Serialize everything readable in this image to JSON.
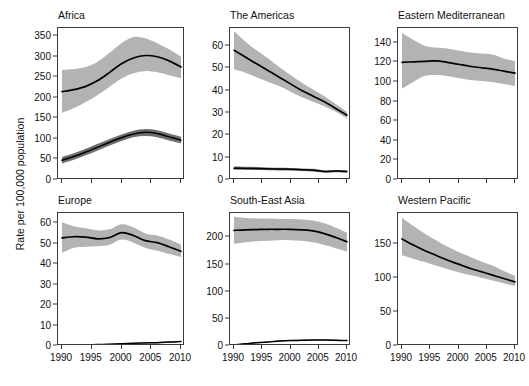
{
  "figure": {
    "ylabel": "Rate per 100,000 population",
    "xlabel": "",
    "xticks": [
      "1990",
      "1995",
      "2000",
      "2005",
      "2010"
    ],
    "xlim": [
      1990,
      2010
    ],
    "grid": false,
    "legend": "none",
    "band_color": "#b3b3b3",
    "band_color_dark": "#6e6e6e",
    "line_color": "#000000"
  },
  "chart_data": [
    {
      "type": "line",
      "title": "Africa",
      "xlabel": "",
      "ylabel": "Rate per 100,000 population",
      "x": [
        1990,
        1992,
        1994,
        1996,
        1998,
        2000,
        2002,
        2004,
        2006,
        2008,
        2010
      ],
      "xlim": [
        1990,
        2010
      ],
      "ylim": [
        0,
        370
      ],
      "yticks": [
        0,
        50,
        100,
        150,
        200,
        250,
        300,
        350
      ],
      "grid": false,
      "series": [
        {
          "name": "incidence",
          "values": [
            215,
            220,
            228,
            242,
            262,
            283,
            297,
            303,
            300,
            290,
            275
          ],
          "ci_low": [
            163,
            175,
            190,
            207,
            227,
            247,
            260,
            265,
            262,
            255,
            248
          ],
          "ci_high": [
            268,
            270,
            275,
            288,
            310,
            333,
            348,
            345,
            333,
            318,
            300
          ]
        },
        {
          "name": "mortality",
          "values": [
            48,
            57,
            68,
            80,
            92,
            103,
            112,
            116,
            113,
            105,
            97
          ],
          "ci_low": [
            40,
            49,
            60,
            72,
            84,
            95,
            104,
            107,
            104,
            96,
            89
          ],
          "ci_high": [
            56,
            65,
            76,
            88,
            100,
            111,
            120,
            124,
            121,
            113,
            105
          ]
        }
      ]
    },
    {
      "type": "line",
      "title": "The Americas",
      "xlabel": "",
      "ylabel": "",
      "x": [
        1990,
        1992,
        1994,
        1996,
        1998,
        2000,
        2002,
        2004,
        2006,
        2008,
        2010
      ],
      "xlim": [
        1990,
        2010
      ],
      "ylim": [
        0,
        68
      ],
      "yticks": [
        0,
        10,
        20,
        30,
        40,
        50,
        60
      ],
      "grid": false,
      "series": [
        {
          "name": "incidence",
          "values": [
            58,
            55,
            52,
            49,
            46,
            43,
            40,
            37.5,
            35,
            32,
            29
          ],
          "ci_low": [
            49.5,
            48,
            46,
            44,
            42,
            39.5,
            37,
            35,
            33,
            30.5,
            27.5
          ],
          "ci_high": [
            66.5,
            62,
            58,
            54.5,
            50.5,
            47,
            43.5,
            40.5,
            37.5,
            34,
            30.5
          ]
        },
        {
          "name": "mortality",
          "values": [
            5.3,
            5.2,
            5.1,
            5.0,
            4.9,
            4.8,
            4.6,
            4.4,
            3.8,
            4.0,
            3.8
          ],
          "ci_low": [
            4.6,
            4.6,
            4.5,
            4.4,
            4.3,
            4.2,
            4.0,
            3.8,
            3.3,
            3.5,
            3.3
          ],
          "ci_high": [
            6.0,
            5.9,
            5.8,
            5.6,
            5.5,
            5.4,
            5.2,
            5.0,
            4.3,
            4.5,
            4.3
          ]
        }
      ]
    },
    {
      "type": "line",
      "title": "Eastern Mediterranean",
      "xlabel": "",
      "ylabel": "",
      "x": [
        1990,
        1992,
        1994,
        1996,
        1998,
        2000,
        2002,
        2004,
        2006,
        2008,
        2010
      ],
      "xlim": [
        1990,
        2010
      ],
      "ylim": [
        0,
        155
      ],
      "yticks": [
        0,
        20,
        40,
        60,
        80,
        100,
        120,
        140
      ],
      "grid": false,
      "series": [
        {
          "name": "incidence",
          "values": [
            120,
            120.5,
            121,
            121.5,
            120,
            118,
            116,
            114.5,
            113,
            111,
            109
          ],
          "ci_low": [
            93,
            100,
            106,
            107,
            106,
            104,
            102,
            101,
            100,
            98,
            96
          ],
          "ci_high": [
            150,
            143,
            137,
            135,
            134,
            132,
            130,
            129,
            128,
            124,
            121
          ]
        },
        {
          "name": "mortality",
          "values": [
            0.7,
            0.8,
            0.8,
            0.9,
            0.9,
            1.0,
            1.0,
            1.1,
            1.1,
            1.2,
            1.2
          ],
          "ci_low": [
            0.4,
            0.5,
            0.5,
            0.6,
            0.6,
            0.7,
            0.7,
            0.8,
            0.8,
            0.9,
            0.9
          ],
          "ci_high": [
            1.1,
            1.2,
            1.2,
            1.3,
            1.3,
            1.4,
            1.4,
            1.5,
            1.5,
            1.6,
            1.6
          ]
        }
      ]
    },
    {
      "type": "line",
      "title": "Europe",
      "xlabel": "",
      "ylabel": "",
      "x": [
        1990,
        1992,
        1994,
        1996,
        1998,
        2000,
        2002,
        2004,
        2006,
        2008,
        2010
      ],
      "xlim": [
        1990,
        2010
      ],
      "ylim": [
        0,
        65
      ],
      "yticks": [
        0,
        10,
        20,
        30,
        40,
        50,
        60
      ],
      "grid": false,
      "series": [
        {
          "name": "incidence",
          "values": [
            52.8,
            53.4,
            53.2,
            52.4,
            53.0,
            55.4,
            54.0,
            51.5,
            50.5,
            48.5,
            46.3
          ],
          "ci_low": [
            45.5,
            48.0,
            48.5,
            48.8,
            49.5,
            52.0,
            50.5,
            48.0,
            46.5,
            45.0,
            43.5
          ],
          "ci_high": [
            60.5,
            58.5,
            57.5,
            56.5,
            57.0,
            59.5,
            58.0,
            55.0,
            54.0,
            52.0,
            49.5
          ]
        },
        {
          "name": "mortality",
          "values": [
            0.4,
            0.5,
            0.6,
            0.7,
            0.9,
            1.1,
            1.3,
            1.5,
            1.6,
            1.9,
            2.2
          ],
          "ci_low": [
            0.2,
            0.3,
            0.4,
            0.5,
            0.7,
            0.9,
            1.1,
            1.3,
            1.4,
            1.6,
            1.9
          ],
          "ci_high": [
            0.6,
            0.7,
            0.8,
            0.9,
            1.1,
            1.3,
            1.5,
            1.7,
            1.9,
            2.2,
            2.5
          ]
        }
      ]
    },
    {
      "type": "line",
      "title": "South-East Asia",
      "xlabel": "",
      "ylabel": "",
      "x": [
        1990,
        1992,
        1994,
        1996,
        1998,
        2000,
        2002,
        2004,
        2006,
        2008,
        2010
      ],
      "xlim": [
        1990,
        2010
      ],
      "ylim": [
        0,
        245
      ],
      "yticks": [
        0,
        50,
        100,
        150,
        200
      ],
      "grid": false,
      "series": [
        {
          "name": "incidence",
          "values": [
            213,
            214,
            214.5,
            215,
            215,
            215,
            214,
            212,
            207,
            200,
            192
          ],
          "ci_low": [
            188,
            191,
            193,
            194,
            195,
            195,
            194,
            191,
            186,
            180,
            174
          ],
          "ci_high": [
            238,
            236,
            235,
            235,
            234,
            234,
            233,
            231,
            226,
            218,
            209
          ]
        },
        {
          "name": "mortality",
          "values": [
            2,
            4,
            6,
            7.5,
            9,
            10,
            10.5,
            11,
            11,
            10.5,
            10
          ],
          "ci_low": [
            1,
            3,
            5,
            6.5,
            8,
            9,
            9.5,
            10,
            10,
            9.5,
            9
          ],
          "ci_high": [
            3,
            5,
            7,
            8.5,
            10,
            11,
            11.5,
            12,
            12,
            11.5,
            11
          ]
        }
      ]
    },
    {
      "type": "line",
      "title": "Western Pacific",
      "xlabel": "",
      "ylabel": "",
      "x": [
        1990,
        1992,
        1994,
        1996,
        1998,
        2000,
        2002,
        2004,
        2006,
        2008,
        2010
      ],
      "xlim": [
        1990,
        2010
      ],
      "ylim": [
        0,
        195
      ],
      "yticks": [
        0,
        50,
        100,
        150
      ],
      "grid": false,
      "series": [
        {
          "name": "incidence",
          "values": [
            157,
            148,
            140,
            133,
            126,
            120,
            114,
            109,
            104,
            99,
            94
          ],
          "ci_low": [
            133,
            128,
            123,
            118,
            113,
            108,
            104,
            100,
            96,
            92,
            88
          ],
          "ci_high": [
            188,
            176,
            165,
            155,
            146,
            138,
            131,
            124,
            118,
            110,
            103
          ]
        },
        {
          "name": "mortality",
          "values": [
            1.6,
            1.6,
            1.6,
            1.6,
            1.6,
            1.6,
            1.6,
            1.6,
            1.6,
            1.6,
            1.6
          ],
          "ci_low": [
            1.2,
            1.2,
            1.2,
            1.2,
            1.2,
            1.2,
            1.2,
            1.2,
            1.2,
            1.2,
            1.2
          ],
          "ci_high": [
            2.0,
            2.0,
            2.0,
            2.0,
            2.0,
            2.0,
            2.0,
            2.0,
            2.0,
            2.0,
            2.0
          ]
        }
      ]
    }
  ]
}
